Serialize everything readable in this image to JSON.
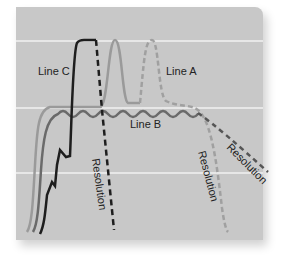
{
  "diagram": {
    "type": "line",
    "background_color": "#c8c8c8",
    "gridline_color": "#f4f4f4",
    "gridlines_y": [
      41,
      108,
      173
    ],
    "lines": [
      {
        "name": "Line A",
        "label": "Line A",
        "color": "#9a9a9a",
        "style": "solid-then-dashed",
        "resolution_label": "Resolution"
      },
      {
        "name": "Line B",
        "label": "Line B",
        "color": "#6a6a6a",
        "style": "solid-wavy-then-dashed",
        "resolution_label": "Resolution"
      },
      {
        "name": "Line C",
        "label": "Line C",
        "color": "#1e1e1e",
        "style": "solid-then-dashed",
        "resolution_label": "Resolution"
      }
    ]
  },
  "labels": {
    "line_a": "Line A",
    "line_b": "Line B",
    "line_c": "Line C",
    "resolution_a": "Resolution",
    "resolution_b": "Resolution",
    "resolution_c": "Resolution"
  }
}
